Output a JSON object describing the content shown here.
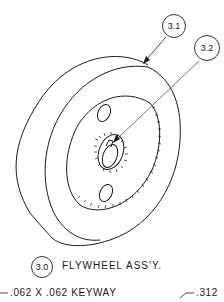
{
  "drawing": {
    "title": "FLYWHEEL ASS'Y.",
    "assembly_balloon": "3.0",
    "callouts": [
      {
        "id": "3.1"
      },
      {
        "id": "3.2"
      }
    ],
    "notes": {
      "keyway": ".062 X .062 KEYWAY",
      "dimension": ".312"
    },
    "line_color": "#1a1a1a"
  }
}
